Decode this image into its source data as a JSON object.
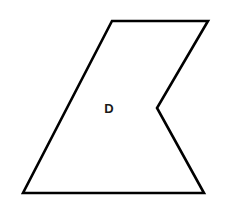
{
  "figure": {
    "background_color": "#ffffff",
    "canvas": {
      "width": 228,
      "height": 212
    },
    "shape": {
      "name": "concave-pentagon",
      "label": "D",
      "label_position": {
        "x": 109,
        "y": 110
      },
      "fill_color": "#ffffff",
      "stroke_color": "#000000",
      "stroke_width": 2.6,
      "vertices": [
        {
          "name": "top-left",
          "x": 112,
          "y": 21
        },
        {
          "name": "top-right",
          "x": 208,
          "y": 21
        },
        {
          "name": "notch-concave",
          "x": 157,
          "y": 108
        },
        {
          "name": "bottom-right",
          "x": 204,
          "y": 193
        },
        {
          "name": "bottom-left",
          "x": 23,
          "y": 193
        }
      ],
      "points_attr": "112,21 208,21 157,108 204,193 23,193"
    }
  }
}
